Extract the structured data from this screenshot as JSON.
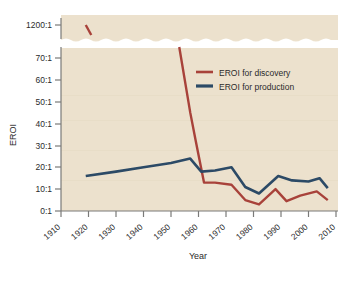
{
  "chart_data": {
    "type": "line",
    "title": "",
    "xlabel": "Year",
    "ylabel": "EROI",
    "xlim": [
      1910,
      2010
    ],
    "ylim": [
      0,
      70
    ],
    "grid": false,
    "legend_position": "upper-right",
    "axis_break": {
      "present": true,
      "below": 70,
      "above_label": "1200:1",
      "note": "wavy break between 70:1 and 1200:1"
    },
    "x_ticks": [
      "1910",
      "1920",
      "1930",
      "1940",
      "1950",
      "1960",
      "1970",
      "1980",
      "1990",
      "2000",
      "2010"
    ],
    "y_ticks": [
      "0:1",
      "10:1",
      "20:1",
      "30:1",
      "40:1",
      "50:1",
      "60:1",
      "70:1",
      "1200:1"
    ],
    "series": [
      {
        "name": "EROI for discovery",
        "color": "#a8423a",
        "points": [
          [
            1919,
            1200
          ],
          [
            1921,
            1000
          ],
          [
            1953,
            75
          ],
          [
            1957,
            45
          ],
          [
            1959,
            32
          ],
          [
            1962,
            13
          ],
          [
            1966,
            13
          ],
          [
            1972,
            12
          ],
          [
            1977,
            5
          ],
          [
            1982,
            3
          ],
          [
            1988,
            10
          ],
          [
            1992,
            4.5
          ],
          [
            1997,
            7
          ],
          [
            2003,
            9
          ],
          [
            2007,
            5
          ]
        ]
      },
      {
        "name": "EROI for production",
        "color": "#2c4a66",
        "points": [
          [
            1919,
            16
          ],
          [
            1930,
            18
          ],
          [
            1940,
            20
          ],
          [
            1950,
            22
          ],
          [
            1957,
            24
          ],
          [
            1961,
            18
          ],
          [
            1966,
            18.5
          ],
          [
            1972,
            20
          ],
          [
            1977,
            11
          ],
          [
            1982,
            8
          ],
          [
            1989,
            16
          ],
          [
            1994,
            14
          ],
          [
            2000,
            13.5
          ],
          [
            2004,
            15
          ],
          [
            2007,
            10.5
          ]
        ]
      }
    ]
  },
  "legend": {
    "items": [
      {
        "label": "EROI for discovery",
        "color": "#a8423a"
      },
      {
        "label": "EROI for production",
        "color": "#2c4a66"
      }
    ]
  },
  "axes": {
    "y_title": "EROI",
    "x_title": "Year"
  },
  "colors": {
    "plot_background": "#ece1cd",
    "page_background": "#ffffff",
    "axis": "#7a7a78",
    "text": "#2b2b2b",
    "discovery": "#a8423a",
    "production": "#2c4a66"
  }
}
